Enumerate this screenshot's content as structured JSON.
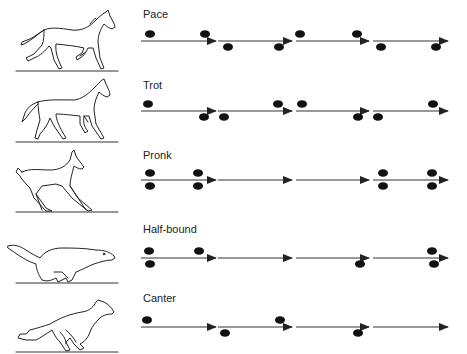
{
  "figure": {
    "colors": {
      "ink": "#222222",
      "dot": "#111111",
      "line": "#333333",
      "background": "#ffffff"
    },
    "arrow_segments": [
      [
        141,
        216
      ],
      [
        218,
        292
      ],
      [
        296,
        369
      ],
      [
        373,
        448
      ]
    ],
    "rows": [
      {
        "label": "Pace",
        "animal": "horse-pace",
        "top": 0,
        "label_y": 8,
        "line_y": 41,
        "ground_y": 71,
        "segments": [
          0,
          1,
          2,
          3
        ],
        "dots": [
          {
            "x": 150,
            "pos": "above"
          },
          {
            "x": 205,
            "pos": "above"
          },
          {
            "x": 300,
            "pos": "above"
          },
          {
            "x": 357,
            "pos": "above"
          },
          {
            "x": 228,
            "pos": "below"
          },
          {
            "x": 279,
            "pos": "below"
          },
          {
            "x": 381,
            "pos": "below"
          },
          {
            "x": 436,
            "pos": "below"
          }
        ]
      },
      {
        "label": "Trot",
        "animal": "horse-trot",
        "top": 0,
        "label_y": 79,
        "line_y": 111,
        "ground_y": 142,
        "segments": [
          0,
          1,
          2,
          3
        ],
        "dots": [
          {
            "x": 148,
            "pos": "above"
          },
          {
            "x": 278,
            "pos": "above"
          },
          {
            "x": 302,
            "pos": "above"
          },
          {
            "x": 433,
            "pos": "above"
          },
          {
            "x": 204,
            "pos": "below"
          },
          {
            "x": 224,
            "pos": "below"
          },
          {
            "x": 358,
            "pos": "below"
          },
          {
            "x": 378,
            "pos": "below"
          }
        ]
      },
      {
        "label": "Pronk",
        "animal": "deer-pronk",
        "top": 0,
        "label_y": 149,
        "line_y": 180,
        "ground_y": 212,
        "segments": [
          0,
          1,
          2,
          3
        ],
        "dots": [
          {
            "x": 150,
            "pos": "above"
          },
          {
            "x": 198,
            "pos": "above"
          },
          {
            "x": 383,
            "pos": "above"
          },
          {
            "x": 432,
            "pos": "above"
          },
          {
            "x": 150,
            "pos": "below"
          },
          {
            "x": 198,
            "pos": "below"
          },
          {
            "x": 383,
            "pos": "below"
          },
          {
            "x": 432,
            "pos": "below"
          }
        ]
      },
      {
        "label": "Half-bound",
        "animal": "rodent-half-bound",
        "top": 0,
        "label_y": 223,
        "line_y": 258,
        "ground_y": 283,
        "segments": [
          0,
          1,
          2,
          3
        ],
        "dots": [
          {
            "x": 149,
            "pos": "above"
          },
          {
            "x": 199,
            "pos": "above"
          },
          {
            "x": 432,
            "pos": "above"
          },
          {
            "x": 150,
            "pos": "below"
          },
          {
            "x": 360,
            "pos": "below"
          },
          {
            "x": 434,
            "pos": "below"
          }
        ]
      },
      {
        "label": "Canter",
        "animal": "dog-canter",
        "top": 0,
        "label_y": 292,
        "line_y": 327,
        "ground_y": 352,
        "segments": [
          0,
          1,
          2,
          3
        ],
        "dots": [
          {
            "x": 147,
            "pos": "above"
          },
          {
            "x": 280,
            "pos": "above"
          },
          {
            "x": 225,
            "pos": "below"
          },
          {
            "x": 358,
            "pos": "below"
          }
        ]
      }
    ]
  }
}
